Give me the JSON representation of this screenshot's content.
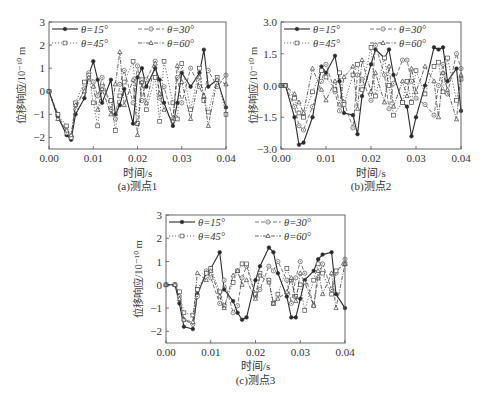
{
  "legend": {
    "entries": [
      {
        "label": "θ=15°",
        "style": "solid",
        "marker": "filled-circle"
      },
      {
        "label": "θ=30°",
        "style": "dashed",
        "marker": "circle-dot"
      },
      {
        "label": "θ=45°",
        "style": "dotted",
        "marker": "square"
      },
      {
        "label": "θ=60°",
        "style": "dashdot",
        "marker": "triangle"
      }
    ]
  },
  "chart_data": [
    {
      "type": "line",
      "title": "(a)测点1",
      "xlabel": "时间/s",
      "ylabel": "位移响应/10⁻¹⁰ m",
      "xlim": [
        0,
        0.04
      ],
      "ylim": [
        -2.5,
        3
      ],
      "xticks": [
        "0.00",
        "0.01",
        "0.02",
        "0.03",
        "0.04"
      ],
      "yticks": [
        "-2",
        "-1",
        "0",
        "1",
        "2",
        "3"
      ],
      "ytick_values": [
        -2,
        -1,
        0,
        1,
        2,
        3
      ],
      "x": [
        0,
        0.002,
        0.004,
        0.005,
        0.006,
        0.008,
        0.009,
        0.01,
        0.011,
        0.012,
        0.014,
        0.015,
        0.016,
        0.017,
        0.019,
        0.02,
        0.021,
        0.022,
        0.024,
        0.025,
        0.026,
        0.028,
        0.029,
        0.03,
        0.032,
        0.034,
        0.035,
        0.036,
        0.038,
        0.04
      ],
      "series": [
        {
          "name": "θ=15°",
          "values": [
            0,
            -1.1,
            -1.9,
            -2.1,
            -1.0,
            -0.3,
            0.7,
            1.3,
            0.5,
            -0.5,
            0.5,
            -1.0,
            -0.6,
            0.1,
            -1.4,
            0.6,
            1.0,
            0.2,
            1.0,
            0.5,
            -0.5,
            -1.5,
            -0.5,
            0.8,
            0.2,
            0.8,
            1.8,
            0.2,
            0.5,
            -0.7
          ]
        },
        {
          "name": "θ=30°",
          "values": [
            0,
            -1.0,
            -1.8,
            -2.0,
            -0.8,
            0.1,
            0.8,
            0.4,
            -0.2,
            0.6,
            -0.8,
            -1.2,
            0.3,
            0.9,
            -0.5,
            1.1,
            -0.4,
            0.5,
            1.3,
            -0.3,
            0.2,
            -1.2,
            0.6,
            -0.5,
            1.0,
            0.2,
            -0.3,
            0.9,
            0.2,
            0.7
          ]
        },
        {
          "name": "θ=45°",
          "values": [
            0,
            -1.0,
            -1.5,
            -2.0,
            -0.5,
            0.4,
            0.7,
            -0.5,
            -1.5,
            0.2,
            -0.4,
            -1.7,
            -0.2,
            0.4,
            1.3,
            -1.4,
            0.5,
            -0.8,
            0.6,
            -1.3,
            1.3,
            -0.5,
            -1.2,
            1.2,
            -0.8,
            1.0,
            -0.4,
            -0.9,
            0.6,
            -1.0
          ]
        },
        {
          "name": "θ=60°",
          "values": [
            0,
            -1.2,
            -1.7,
            -1.9,
            -0.6,
            0.0,
            0.6,
            0.2,
            -0.8,
            0.1,
            -1.0,
            0.3,
            1.7,
            -0.6,
            0.5,
            -1.9,
            0.4,
            -0.5,
            1.2,
            -0.1,
            -0.8,
            -1.3,
            1.1,
            0.4,
            -1.2,
            0.6,
            -0.2,
            -1.5,
            0.5,
            0.3
          ]
        }
      ]
    },
    {
      "type": "line",
      "title": "(b)测点2",
      "xlabel": "时间/s",
      "ylabel": "位移响应/10⁻¹⁰ m",
      "xlim": [
        0,
        0.04
      ],
      "ylim": [
        -3.0,
        3.0
      ],
      "xticks": [
        "0.00",
        "0.01",
        "0.02",
        "0.03",
        "0.04"
      ],
      "yticks": [
        "-3.0",
        "-1.5",
        "0.0",
        "1.5",
        "3.0"
      ],
      "ytick_values": [
        -3.0,
        -1.5,
        0.0,
        1.5,
        3.0
      ],
      "x": [
        0,
        0.001,
        0.003,
        0.004,
        0.005,
        0.007,
        0.009,
        0.01,
        0.012,
        0.013,
        0.014,
        0.016,
        0.017,
        0.018,
        0.02,
        0.021,
        0.023,
        0.024,
        0.025,
        0.027,
        0.028,
        0.029,
        0.03,
        0.032,
        0.034,
        0.035,
        0.036,
        0.037,
        0.039,
        0.04
      ],
      "series": [
        {
          "name": "θ=15°",
          "values": [
            0,
            0,
            -1.5,
            -2.8,
            -2.7,
            -1.5,
            0.9,
            0.6,
            1.4,
            0.2,
            -1.3,
            -1.4,
            -2.3,
            -0.5,
            1.0,
            1.7,
            1.3,
            1.7,
            0.5,
            -0.8,
            -1.0,
            -2.4,
            -1.5,
            0.0,
            1.8,
            1.7,
            1.8,
            0.2,
            0.8,
            -1.2
          ]
        },
        {
          "name": "θ=30°",
          "values": [
            0,
            0,
            -1.0,
            -1.9,
            -2.1,
            -1.0,
            0.2,
            1.0,
            -0.3,
            -1.2,
            -0.8,
            -2.0,
            0.5,
            0.3,
            -0.7,
            1.9,
            0.5,
            -1.1,
            0.1,
            1.2,
            1.2,
            0.2,
            -0.6,
            -0.9,
            -1.4,
            0.0,
            1.0,
            -0.4,
            1.5,
            0.8
          ]
        },
        {
          "name": "θ=45°",
          "values": [
            0,
            0,
            -0.6,
            -1.3,
            -1.5,
            -0.3,
            0.7,
            0.4,
            -0.2,
            0.6,
            -0.9,
            0.5,
            1.0,
            -0.2,
            1.8,
            -0.5,
            1.3,
            0.0,
            -1.4,
            -0.8,
            0.2,
            -0.8,
            0.7,
            -0.4,
            0.9,
            1.1,
            -0.3,
            1.3,
            -0.7,
            0.3
          ]
        },
        {
          "name": "θ=60°",
          "values": [
            0,
            0,
            -0.4,
            -0.8,
            -1.3,
            0.8,
            -0.2,
            -0.7,
            0.2,
            -0.9,
            0.4,
            0.9,
            -1.1,
            1.2,
            -0.3,
            0.6,
            -0.8,
            0.9,
            -1.0,
            0.2,
            -0.5,
            0.8,
            -0.3,
            0.9,
            0.2,
            -1.5,
            0.6,
            -0.2,
            -1.6,
            0.5
          ]
        }
      ]
    },
    {
      "type": "line",
      "title": "(c)测点3",
      "xlabel": "时间/s",
      "ylabel": "位移响应/10⁻¹⁰ m",
      "xlim": [
        0,
        0.04
      ],
      "ylim": [
        -2.5,
        3
      ],
      "xticks": [
        "0.00",
        "0.01",
        "0.02",
        "0.03",
        "0.04"
      ],
      "yticks": [
        "-2",
        "-1",
        "0",
        "1",
        "2",
        "3"
      ],
      "ytick_values": [
        -2,
        -1,
        0,
        1,
        2,
        3
      ],
      "x": [
        0,
        0.002,
        0.003,
        0.004,
        0.006,
        0.007,
        0.009,
        0.01,
        0.012,
        0.013,
        0.015,
        0.016,
        0.017,
        0.018,
        0.02,
        0.021,
        0.023,
        0.024,
        0.025,
        0.027,
        0.028,
        0.029,
        0.03,
        0.031,
        0.033,
        0.034,
        0.035,
        0.037,
        0.038,
        0.04
      ],
      "series": [
        {
          "name": "θ=15°",
          "values": [
            0,
            0,
            -0.8,
            -1.8,
            -1.9,
            -0.4,
            0.5,
            0.7,
            1.4,
            -0.2,
            -0.7,
            -1.2,
            -1.5,
            -1.4,
            0.2,
            0.8,
            1.6,
            1.4,
            0.5,
            -0.5,
            -1.4,
            -1.4,
            -0.6,
            0.2,
            0.6,
            1.1,
            1.3,
            1.4,
            -0.4,
            -1.0
          ]
        },
        {
          "name": "θ=30°",
          "values": [
            0,
            0,
            -0.5,
            -1.5,
            -1.7,
            -0.5,
            0.6,
            0.3,
            -0.8,
            0.2,
            -1.2,
            -0.9,
            0.3,
            0.8,
            -0.5,
            -0.2,
            0.8,
            0.6,
            1.0,
            0.2,
            -0.8,
            0.3,
            1.0,
            0.5,
            -0.9,
            0.3,
            0.9,
            -0.2,
            0.5,
            1.1
          ]
        },
        {
          "name": "θ=45°",
          "values": [
            0,
            0,
            -0.3,
            -1.2,
            -1.3,
            -0.2,
            0.5,
            0.7,
            -0.3,
            -0.9,
            0.1,
            0.6,
            0.9,
            0.9,
            -0.4,
            0.5,
            0.2,
            -0.8,
            -0.4,
            0.7,
            0.2,
            -0.5,
            0.0,
            -1.1,
            0.2,
            0.9,
            0.5,
            -0.4,
            0.6,
            0.9
          ]
        },
        {
          "name": "θ=60°",
          "values": [
            0,
            0,
            -0.6,
            -1.5,
            -1.6,
            0.5,
            0.2,
            0.6,
            -0.5,
            -1.0,
            0.4,
            0.6,
            0.0,
            0.2,
            -0.6,
            0.4,
            0.1,
            -0.8,
            -0.6,
            -0.3,
            0.3,
            -0.7,
            0.5,
            0.1,
            -0.9,
            0.6,
            -0.4,
            0.5,
            -1.0,
            0.9
          ]
        }
      ]
    }
  ]
}
